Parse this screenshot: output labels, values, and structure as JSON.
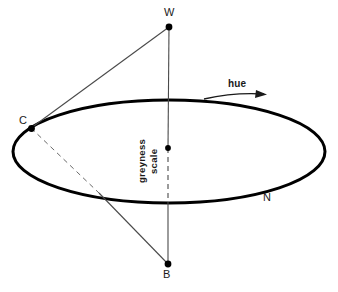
{
  "figure": {
    "labels": {
      "white_vertex": "W",
      "black_vertex": "B",
      "chroma_point": "C",
      "neutral_point": "N",
      "hue_arrow": "hue",
      "greyness_line1": "greyness",
      "greyness_line2": "scale"
    },
    "colors": {
      "stroke": "#000000",
      "ink": "#1a1a1a",
      "background": "#ffffff"
    },
    "geometry": {
      "ellipse": {
        "cx": 169,
        "cy": 151.5,
        "rx": 156,
        "ry": 51.5
      },
      "points": {
        "W": {
          "x": 169,
          "y": 27
        },
        "B": {
          "x": 168,
          "y": 264
        },
        "C": {
          "x": 31,
          "y": 128
        },
        "center": {
          "x": 168,
          "y": 148
        }
      }
    }
  }
}
